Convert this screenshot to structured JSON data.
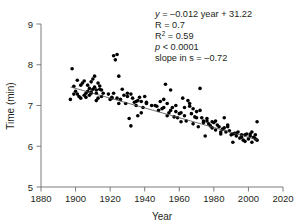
{
  "chart_data": {
    "type": "scatter",
    "title": "",
    "xlabel": "Year",
    "ylabel": "Time (min)",
    "xlim": [
      1880,
      2020
    ],
    "ylim": [
      5,
      9
    ],
    "xticks": [
      1880,
      1900,
      1920,
      1940,
      1960,
      1980,
      2000,
      2020
    ],
    "yticks": [
      5,
      6,
      7,
      8,
      9
    ],
    "xtick_labels": [
      "1880",
      "1900",
      "1920",
      "1940",
      "1960",
      "1980",
      "2000",
      "2020"
    ],
    "ytick_labels": [
      "5",
      "6",
      "7",
      "8",
      "9"
    ],
    "grid": false,
    "legend": null,
    "marker": {
      "shape": "circle",
      "color": "#000000",
      "size_px": 3.6
    },
    "fit_line": {
      "type": "linear",
      "equation": "y = -0.012 year + 31.22",
      "slope": -0.012,
      "intercept": 31.22,
      "x_start": 1897,
      "x_end": 2005,
      "y_start": 7.456,
      "y_end": 6.16,
      "color": "#4d4d4f"
    },
    "annotations": {
      "equation_lhs": "y",
      "equation_rhs": " = –0.012 year + 31.22",
      "r_line": "R = 0.7",
      "r2_base": "R",
      "r2_sup": "2",
      "r2_rest": " = 0.59",
      "p_symbol": "p",
      "p_rest": " < 0.0001",
      "slope_line": "slope in s = –0.72"
    },
    "series": [
      {
        "name": "Winning time",
        "x": [
          1897,
          1898,
          1899,
          1900,
          1901,
          1901,
          1902,
          1903,
          1904,
          1905,
          1906,
          1906,
          1907,
          1908,
          1908,
          1909,
          1909,
          1910,
          1910,
          1911,
          1911,
          1912,
          1912,
          1913,
          1913,
          1914,
          1915,
          1916,
          1919,
          1920,
          1921,
          1922,
          1922,
          1923,
          1924,
          1924,
          1925,
          1926,
          1927,
          1928,
          1929,
          1930,
          1931,
          1932,
          1933,
          1934,
          1935,
          1936,
          1936,
          1937,
          1938,
          1939,
          1940,
          1941,
          1946,
          1947,
          1948,
          1949,
          1950,
          1951,
          1952,
          1953,
          1953,
          1954,
          1955,
          1956,
          1957,
          1958,
          1959,
          1960,
          1961,
          1962,
          1963,
          1964,
          1965,
          1966,
          1967,
          1968,
          1969,
          1970,
          1971,
          1972,
          1973,
          1974,
          1975,
          1976,
          1977,
          1978,
          1979,
          1980,
          1981,
          1982,
          1983,
          1984,
          1985,
          1986,
          1987,
          1988,
          1989,
          1990,
          1991,
          1992,
          1993,
          1994,
          1995,
          1996,
          1997,
          1998,
          1999,
          2000,
          2001,
          2002,
          2003,
          2004,
          2005,
          1905,
          1907,
          1912,
          1914,
          1921,
          1932,
          1938,
          1944,
          1951,
          1958,
          1963,
          1968,
          1972,
          1976,
          1981,
          1986,
          1991,
          1996,
          2001,
          2004,
          1899,
          1903,
          1909,
          1915,
          1925,
          1930,
          1935,
          1941,
          1955,
          1961,
          1966,
          1970,
          1974,
          1979,
          1984,
          1988,
          1993,
          1998,
          2002,
          2005
        ],
        "y": [
          7.15,
          7.9,
          7.47,
          7.35,
          7.62,
          7.28,
          7.22,
          7.18,
          7.55,
          7.6,
          7.3,
          7.2,
          7.5,
          7.42,
          7.25,
          7.58,
          7.33,
          7.65,
          7.4,
          7.72,
          7.45,
          7.3,
          7.12,
          7.55,
          7.18,
          7.4,
          7.22,
          7.3,
          7.28,
          7.15,
          7.2,
          8.22,
          7.3,
          8.12,
          8.25,
          7.18,
          7.72,
          7.15,
          7.4,
          7.25,
          7.05,
          7.3,
          6.68,
          6.5,
          7.18,
          7.08,
          7.1,
          7.12,
          6.75,
          7.2,
          7.1,
          6.95,
          7.22,
          7.05,
          7.0,
          6.98,
          6.88,
          7.1,
          6.92,
          6.95,
          7.52,
          7.05,
          6.75,
          6.82,
          7.38,
          6.95,
          6.72,
          6.85,
          6.7,
          6.8,
          6.6,
          7.18,
          6.95,
          6.62,
          7.12,
          7.05,
          6.8,
          6.55,
          6.72,
          6.85,
          6.48,
          7.42,
          6.7,
          6.58,
          6.25,
          6.62,
          6.55,
          6.5,
          6.45,
          6.58,
          6.4,
          6.52,
          6.48,
          6.3,
          6.42,
          6.7,
          6.35,
          6.52,
          6.38,
          6.28,
          6.1,
          6.32,
          6.25,
          6.35,
          6.2,
          6.28,
          6.15,
          6.12,
          6.3,
          6.18,
          6.25,
          6.1,
          6.22,
          6.28,
          6.6,
          7.25,
          7.35,
          7.38,
          7.48,
          7.18,
          7.28,
          6.82,
          7.0,
          7.15,
          7.0,
          6.75,
          6.92,
          6.88,
          6.68,
          6.62,
          6.45,
          6.3,
          6.22,
          6.3,
          6.18,
          7.28,
          7.5,
          7.3,
          7.38,
          7.05,
          7.22,
          7.0,
          7.08,
          6.88,
          6.82,
          6.98,
          6.7,
          6.62,
          6.6,
          6.35,
          6.48,
          6.32,
          6.28,
          6.35,
          6.15
        ]
      }
    ]
  }
}
